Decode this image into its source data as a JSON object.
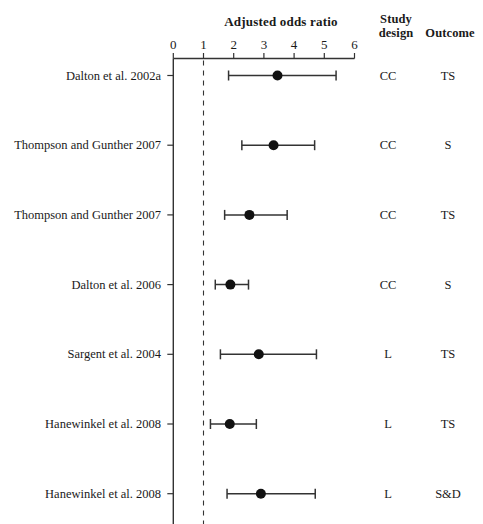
{
  "headers": {
    "axis_title": "Adjusted odds ratio",
    "study_design_line1": "Study",
    "study_design_line2": "design",
    "outcome": "Outcome"
  },
  "axis": {
    "ticks": [
      0,
      1,
      2,
      3,
      4,
      5,
      6
    ],
    "tick_labels": [
      "0",
      "1",
      "2",
      "3",
      "4",
      "5",
      "6"
    ],
    "reference_line": 1,
    "min": 0,
    "max": 6
  },
  "colors": {
    "line": "#333333",
    "marker": "#111111",
    "text": "#1a1a1a",
    "background": "#ffffff"
  },
  "chart_data": {
    "type": "scatter",
    "title": "Adjusted odds ratio",
    "xlabel": "Adjusted odds ratio",
    "ylabel": "",
    "xlim": [
      0,
      6
    ],
    "xticks": [
      0,
      1,
      2,
      3,
      4,
      5,
      6
    ],
    "grid": false,
    "legend": "none",
    "reference_line_x": 1,
    "columns": [
      "Study",
      "Adjusted odds ratio",
      "Study design",
      "Outcome"
    ],
    "rows": [
      {
        "study": "Dalton et al. 2002a",
        "estimate": 3.45,
        "ci_low": 1.83,
        "ci_high": 5.39,
        "design": "CC",
        "outcome": "TS"
      },
      {
        "study": "Thompson and Gunther 2007",
        "estimate": 3.32,
        "ci_low": 2.27,
        "ci_high": 4.68,
        "design": "CC",
        "outcome": "S"
      },
      {
        "study": "Thompson and Gunther 2007",
        "estimate": 2.52,
        "ci_low": 1.7,
        "ci_high": 3.77,
        "design": "CC",
        "outcome": "TS"
      },
      {
        "study": "Dalton et al. 2006",
        "estimate": 1.89,
        "ci_low": 1.39,
        "ci_high": 2.49,
        "design": "CC",
        "outcome": "S"
      },
      {
        "study": "Sargent et al. 2004",
        "estimate": 2.83,
        "ci_low": 1.56,
        "ci_high": 4.74,
        "design": "L",
        "outcome": "TS"
      },
      {
        "study": "Hanewinkel et al. 2008",
        "estimate": 1.87,
        "ci_low": 1.23,
        "ci_high": 2.75,
        "design": "L",
        "outcome": "TS"
      },
      {
        "study": "Hanewinkel et al. 2008",
        "estimate": 2.9,
        "ci_low": 1.78,
        "ci_high": 4.7,
        "design": "L",
        "outcome": "S&D"
      }
    ]
  }
}
